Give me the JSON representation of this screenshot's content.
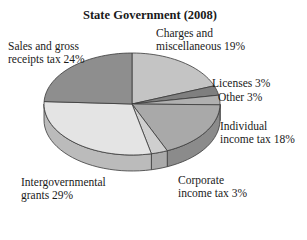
{
  "chart_data": {
    "type": "pie",
    "title": "State Government (2008)",
    "style": "3d",
    "start_angle_deg": 90,
    "direction": "clockwise",
    "slices": [
      {
        "label": "Charges and miscellaneous",
        "value": 19,
        "color": "#c4c4c4"
      },
      {
        "label": "Licenses",
        "value": 3,
        "color": "#7f7f7f"
      },
      {
        "label": "Other",
        "value": 3,
        "color": "#b0b0b0"
      },
      {
        "label": "Individual income tax",
        "value": 18,
        "color": "#a9a9a9"
      },
      {
        "label": "Corporate income tax",
        "value": 3,
        "color": "#cfcfcf"
      },
      {
        "label": "Intergovernmental grants",
        "value": 29,
        "color": "#e4e4e4"
      },
      {
        "label": "Sales and gross receipts tax",
        "value": 24,
        "color": "#8e8e8e"
      }
    ],
    "unit": "%"
  },
  "labels": {
    "title": "State Government (2008)",
    "sales_line1": "Sales and gross",
    "sales_line2": "receipts tax 24%",
    "charges_line1": "Charges and",
    "charges_line2": "miscellaneous 19%",
    "licenses": "Licenses 3%",
    "other": "Other 3%",
    "individual_line1": "Individual",
    "individual_line2": "income tax 18%",
    "corporate_line1": "Corporate",
    "corporate_line2": "income tax 3%",
    "intergov_line1": "Intergovernmental",
    "intergov_line2": "grants 29%"
  }
}
